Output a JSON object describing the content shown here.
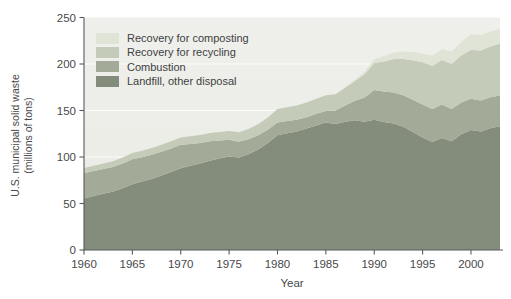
{
  "figure": {
    "y_axis_title_line1": "U.S. municipal solid waste",
    "y_axis_title_line2": "(millions of tons)",
    "x_axis_title": "Year"
  },
  "chart_data": {
    "type": "area",
    "stacked": true,
    "title": "",
    "xlabel": "Year",
    "ylabel": "U.S. municipal solid waste (millions of tons)",
    "xlim": [
      1960,
      2003
    ],
    "ylim": [
      0,
      250
    ],
    "x_ticks": [
      1960,
      1965,
      1970,
      1975,
      1980,
      1985,
      1990,
      1995,
      2000
    ],
    "y_ticks": [
      0,
      50,
      100,
      150,
      200,
      250
    ],
    "grid": "white horizontal gridlines at 50-unit intervals behind areas",
    "legend_position": "top-left inside plot",
    "plot_background": "#eff0ec",
    "plot_background_bottom": "#e9ebe3",
    "gridline_color": "#ffffff",
    "axis_color": "#595a5c",
    "text_color": "#47484a",
    "legend": [
      {
        "label": "Recovery for composting",
        "color": "#e0e4d6"
      },
      {
        "label": "Recovery for recycling",
        "color": "#c5cbb9"
      },
      {
        "label": "Combustion",
        "color": "#a3aa98"
      },
      {
        "label": "Landfill, other disposal",
        "color": "#848c7b"
      }
    ],
    "x": [
      1960,
      1961,
      1962,
      1963,
      1964,
      1965,
      1966,
      1967,
      1968,
      1969,
      1970,
      1971,
      1972,
      1973,
      1974,
      1975,
      1976,
      1977,
      1978,
      1979,
      1980,
      1981,
      1982,
      1983,
      1984,
      1985,
      1986,
      1987,
      1988,
      1989,
      1990,
      1991,
      1992,
      1993,
      1994,
      1995,
      1996,
      1997,
      1998,
      1999,
      2000,
      2001,
      2002,
      2003
    ],
    "series": [
      {
        "name": "Landfill, other disposal",
        "stack_order": "bottom",
        "color": "#848c7b",
        "values": [
          55.5,
          58.0,
          60.5,
          63.0,
          66.5,
          70.8,
          73.5,
          76.5,
          80.0,
          84.0,
          88.0,
          90.5,
          93.0,
          96.0,
          98.5,
          100.5,
          99.5,
          103.0,
          108.0,
          115.0,
          123.4,
          125.5,
          127.5,
          130.5,
          134.0,
          137.0,
          135.5,
          138.0,
          139.5,
          138.0,
          140.1,
          137.5,
          136.0,
          132.5,
          127.0,
          121.0,
          116.0,
          120.5,
          117.0,
          124.5,
          128.9,
          127.5,
          131.0,
          133.0
        ]
      },
      {
        "name": "Combustion",
        "stack_order": "second",
        "color": "#a3aa98",
        "values": [
          27.0,
          26.8,
          26.6,
          26.4,
          26.5,
          26.8,
          26.3,
          25.9,
          25.6,
          25.3,
          25.1,
          23.6,
          22.2,
          21.0,
          19.4,
          18.0,
          17.0,
          16.1,
          15.3,
          14.4,
          13.7,
          13.1,
          12.6,
          12.3,
          12.4,
          12.6,
          14.4,
          17.4,
          21.0,
          26.0,
          31.9,
          32.8,
          33.3,
          33.8,
          34.6,
          35.5,
          35.6,
          36.1,
          34.6,
          34.0,
          33.7,
          33.4,
          33.3,
          33.1
        ]
      },
      {
        "name": "Recovery for recycling",
        "stack_order": "third",
        "color": "#c5cbb9",
        "values": [
          5.6,
          5.8,
          5.9,
          6.1,
          6.4,
          6.8,
          7.0,
          7.2,
          7.5,
          7.7,
          8.0,
          8.2,
          8.5,
          8.8,
          9.1,
          9.3,
          10.1,
          11.0,
          12.0,
          13.2,
          14.5,
          14.9,
          15.3,
          15.8,
          16.2,
          16.7,
          17.6,
          19.0,
          21.3,
          25.0,
          29.0,
          32.5,
          36.0,
          39.2,
          42.5,
          45.3,
          46.5,
          47.6,
          48.6,
          50.5,
          52.8,
          53.6,
          54.6,
          55.8
        ]
      },
      {
        "name": "Recovery for composting",
        "stack_order": "top",
        "color": "#e0e4d6",
        "values": [
          0,
          0,
          0,
          0,
          0,
          0,
          0,
          0,
          0,
          0,
          0,
          0,
          0,
          0,
          0,
          0,
          0,
          0,
          0,
          0,
          0,
          0,
          0,
          0,
          0,
          0,
          0.3,
          0.7,
          1.5,
          2.7,
          4.2,
          5.8,
          7.0,
          8.0,
          8.9,
          9.6,
          10.8,
          11.9,
          13.1,
          14.8,
          16.5,
          16.6,
          16.0,
          16.1
        ]
      }
    ]
  }
}
